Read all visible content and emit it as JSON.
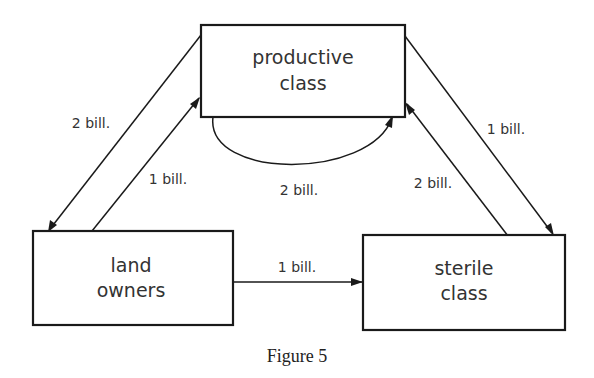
{
  "diagram": {
    "nodes": [
      {
        "id": "productive",
        "line1": "productive",
        "line2": "class"
      },
      {
        "id": "land_owners",
        "line1": "land",
        "line2": "owners"
      },
      {
        "id": "sterile",
        "line1": "sterile",
        "line2": "class"
      }
    ],
    "edges": [
      {
        "from": "productive",
        "to": "land_owners",
        "label": "2 bill."
      },
      {
        "from": "land_owners",
        "to": "productive",
        "label": "1 bill."
      },
      {
        "from": "productive",
        "to": "productive",
        "label": "2 bill."
      },
      {
        "from": "productive",
        "to": "sterile",
        "label": "1 bill."
      },
      {
        "from": "sterile",
        "to": "productive",
        "label": "2 bill."
      },
      {
        "from": "land_owners",
        "to": "sterile",
        "label": "1 bill."
      }
    ],
    "caption": "Figure 5"
  }
}
